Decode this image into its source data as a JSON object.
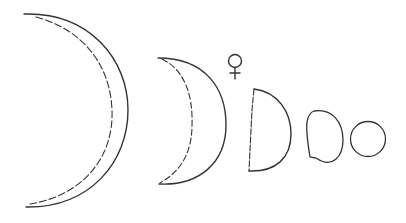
{
  "symbol": "♀",
  "stroke_color": "#333333",
  "phases": [
    {
      "name": "large-crescent"
    },
    {
      "name": "crescent"
    },
    {
      "name": "half"
    },
    {
      "name": "gibbous"
    },
    {
      "name": "full"
    }
  ]
}
